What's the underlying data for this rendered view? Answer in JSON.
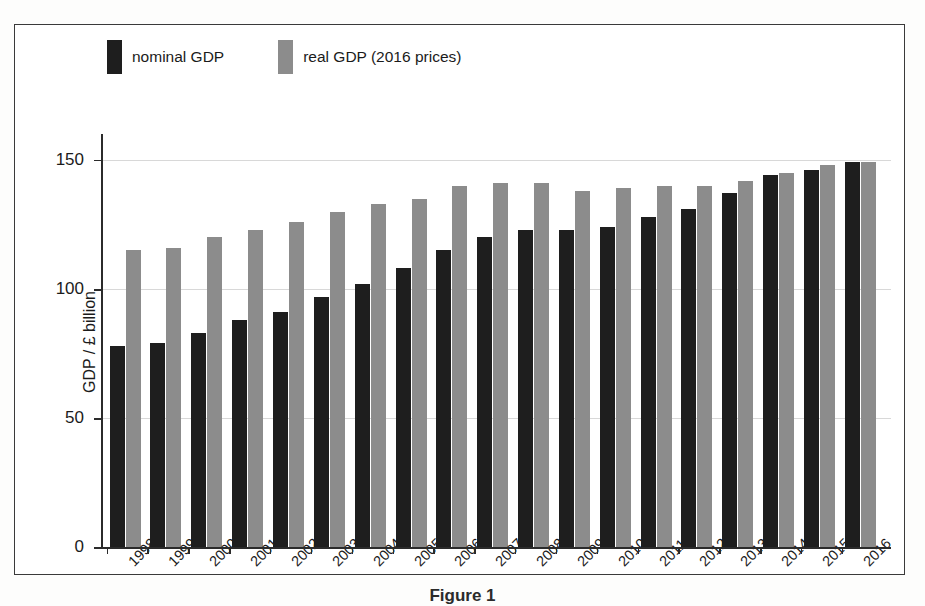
{
  "figure": {
    "caption": "Figure 1",
    "legend": [
      {
        "label": "nominal GDP",
        "color": "#1e1e1e",
        "key": "nominal"
      },
      {
        "label": "real GDP (2016 prices)",
        "color": "#8c8c8c",
        "key": "real"
      }
    ]
  },
  "axes": {
    "y_title": "GDP / £ billion",
    "y_ticks": [
      "0",
      "50",
      "100",
      "150"
    ],
    "x_title": ""
  },
  "chart_data": {
    "type": "bar",
    "title": "",
    "subtitle": "",
    "xlabel": "",
    "ylabel": "GDP / £ billion",
    "ylim": [
      0,
      160
    ],
    "yticks": [
      0,
      50,
      100,
      150
    ],
    "grid": true,
    "legend_position": "top-left",
    "categories": [
      "1998",
      "1999",
      "2000",
      "2001",
      "2002",
      "2003",
      "2004",
      "2005",
      "2006",
      "2007",
      "2008",
      "2009",
      "2010",
      "2011",
      "2012",
      "2013",
      "2014",
      "2015",
      "2016"
    ],
    "series": [
      {
        "name": "nominal GDP",
        "color": "#1e1e1e",
        "values": [
          78,
          79,
          83,
          88,
          91,
          97,
          102,
          108,
          115,
          120,
          123,
          123,
          124,
          128,
          131,
          137,
          144,
          146,
          149
        ]
      },
      {
        "name": "real GDP (2016 prices)",
        "color": "#8c8c8c",
        "values": [
          115,
          116,
          120,
          123,
          126,
          130,
          133,
          135,
          140,
          141,
          141,
          138,
          139,
          140,
          140,
          142,
          145,
          148,
          149
        ]
      }
    ]
  }
}
